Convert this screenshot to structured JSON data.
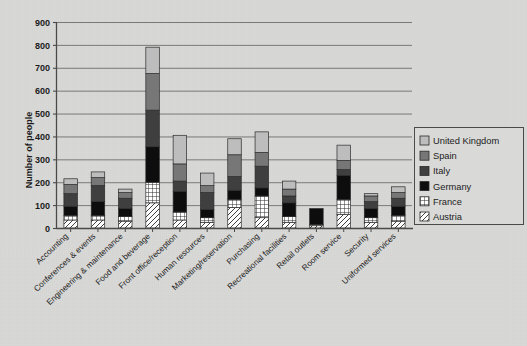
{
  "chart_data": {
    "type": "bar",
    "stacked": true,
    "title": "",
    "xlabel": "",
    "ylabel": "Number of people",
    "ylim": [
      0,
      900
    ],
    "ytick_step": 100,
    "yticks": [
      0,
      100,
      200,
      300,
      400,
      500,
      600,
      700,
      800,
      900
    ],
    "grid": true,
    "legend_position": "right",
    "categories": [
      "Accounting",
      "Conferences & events",
      "Engineering & maintenance",
      "Food and beverage",
      "Front office/reception",
      "Human resources",
      "Marketing/reservation",
      "Purchasing",
      "Recreational facilities",
      "Retail outlets",
      "Room service",
      "Security",
      "Uniformed services"
    ],
    "series": [
      {
        "name": "Austria",
        "color": "#ffffff",
        "pattern": "diagonal",
        "values": [
          35,
          35,
          30,
          110,
          35,
          25,
          90,
          45,
          25,
          10,
          60,
          25,
          30
        ]
      },
      {
        "name": "France",
        "color": "#e8e8e8",
        "pattern": "grid",
        "values": [
          20,
          20,
          20,
          90,
          35,
          20,
          35,
          95,
          25,
          5,
          65,
          20,
          25
        ]
      },
      {
        "name": "Germany",
        "color": "#0d0d0d",
        "pattern": "solid",
        "values": [
          40,
          60,
          35,
          155,
          90,
          35,
          40,
          35,
          60,
          70,
          105,
          40,
          40
        ]
      },
      {
        "name": "Italy",
        "color": "#3f3f3f",
        "pattern": "solid",
        "values": [
          55,
          70,
          45,
          160,
          45,
          75,
          60,
          95,
          30,
          0,
          25,
          30,
          35
        ]
      },
      {
        "name": "Spain",
        "color": "#777777",
        "pattern": "solid",
        "values": [
          40,
          35,
          25,
          160,
          75,
          30,
          95,
          60,
          30,
          0,
          40,
          25,
          25
        ]
      },
      {
        "name": "United Kingdom",
        "color": "#bdbdbd",
        "pattern": "solid",
        "values": [
          25,
          25,
          15,
          115,
          125,
          55,
          70,
          90,
          35,
          0,
          67,
          10,
          25
        ]
      }
    ],
    "totals": [
      215,
      245,
      170,
      790,
      405,
      240,
      390,
      420,
      205,
      85,
      362,
      150,
      180
    ]
  },
  "legend": {
    "entries": [
      {
        "label": "United Kingdom"
      },
      {
        "label": "Spain"
      },
      {
        "label": "Italy"
      },
      {
        "label": "Germany"
      },
      {
        "label": "France"
      },
      {
        "label": "Austria"
      }
    ]
  },
  "axis": {
    "y_title": "Number of people"
  }
}
